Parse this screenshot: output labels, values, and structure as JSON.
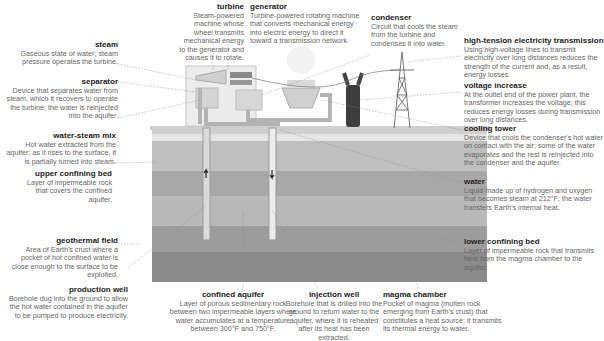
{
  "labels": {
    "turbine": {
      "title": "turbine",
      "desc": "Steam-powered machine whose wheel transmits mechanical energy to the generator and causes it to rotate."
    },
    "generator": {
      "title": "generator",
      "desc": "Turbine-powered rotating machine that converts mechanical energy into electric energy to direct it toward a transmission network."
    },
    "condenser": {
      "title": "condenser",
      "desc": "Circuit that cools the steam from the turbine and condenses it into water."
    },
    "steam": {
      "title": "steam",
      "desc": "Gaseous state of water; steam pressure operates the turbine."
    },
    "separator": {
      "title": "separator",
      "desc": "Device that separates water from steam, which it recovers to operate the turbine; the water is reinjected into the aquifer."
    },
    "water_steam_mix": {
      "title": "water-steam mix",
      "desc": "Hot water extracted from the aquifer; as it rises to the surface, it is partially turned into steam."
    },
    "upper_confining_bed": {
      "title": "upper confining bed",
      "desc": "Layer of impermeable rock that covers the confined aquifer."
    },
    "geothermal_field": {
      "title": "geothermal field",
      "desc": "Area of Earth's crust where a pocket of hot confined water is close enough to the surface to be exploited."
    },
    "production_well": {
      "title": "production well",
      "desc": "Borehole dug into the ground to allow the hot water contained in the aquifer to be pumped to produce electricity."
    },
    "confined_aquifer": {
      "title": "confined aquifer",
      "desc": "Layer of porous sedimentary rock between two impermeable layers where water accumulates at a temperature between 300°F and 750°F."
    },
    "injection_well": {
      "title": "injection well",
      "desc": "Borehole that is drilled into the ground to return water to the aquifer, where it is reheated after its heat has been extracted."
    },
    "magma_chamber": {
      "title": "magma chamber",
      "desc": "Pocket of magma (molten rock emerging from Earth's crust) that constitutes a heat source; it transmits its thermal energy to water."
    },
    "high_tension": {
      "title": "high-tension electricity transmission",
      "desc": "Using high-voltage lines to transmit electricity over long distances reduces the strength of the current and, as a result, energy losses."
    },
    "voltage_increase": {
      "title": "voltage increase",
      "desc": "At the outlet end of the power plant, the transformer increases the voltage; this reduces energy losses during transmission over long distances."
    },
    "cooling_tower": {
      "title": "cooling tower",
      "desc": "Device that cools the condenser's hot water on contact with the air; some of the water evaporates and the rest is reinjected into the condenser and the aquifer."
    },
    "water": {
      "title": "water",
      "desc": "Liquid made up of hydrogen and oxygen that becomes steam at 212°F; the water transfers Earth's internal heat."
    },
    "lower_confining_bed": {
      "title": "lower confining bed",
      "desc": "Layer of impermeable rock that transmits heat from the magma chamber to the aquifer."
    }
  },
  "colors": {
    "ground_surface": "#c9c9c9",
    "layer1": "#bdbdbd",
    "layer2": "#a9a9a9",
    "layer3": "#b8b8b8",
    "layer4": "#9a9a9a",
    "layer5": "#8a8a8a",
    "pipe": "#b5b5b5",
    "plant": "#e3e3e3",
    "transformer": "#444444"
  }
}
